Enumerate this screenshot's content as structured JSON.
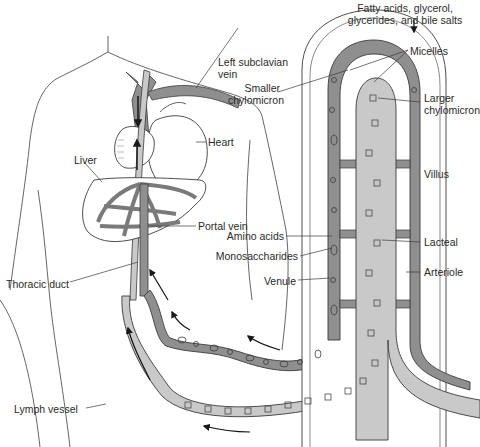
{
  "diagram": {
    "colors": {
      "blood_vessel": "#8f8f8f",
      "lymph_vessel": "#c9c9c9",
      "outline": "#3a3a3a",
      "background": "#ffffff",
      "text": "#2a2a2a"
    },
    "labels": {
      "fatty_acids_line1": "Fatty acids, glycerol,",
      "fatty_acids_line2": "glycerides, and bile salts",
      "micelles": "Micelles",
      "smaller_chylomicron_line1": "Smaller",
      "smaller_chylomicron_line2": "chylomicron",
      "larger_chylomicron_line1": "Larger",
      "larger_chylomicron_line2": "chylomicron",
      "left_subclavian_line1": "Left subclavian",
      "left_subclavian_line2": "vein",
      "heart": "Heart",
      "liver": "Liver",
      "portal_vein": "Portal vein",
      "villus": "Villus",
      "amino_acids": "Amino acids",
      "monosaccharides": "Monosaccharides",
      "lacteal": "Lacteal",
      "arteriole": "Arteriole",
      "venule": "Venule",
      "thoracic_duct": "Thoracic duct",
      "lymph_vessel": "Lymph vessel"
    }
  }
}
